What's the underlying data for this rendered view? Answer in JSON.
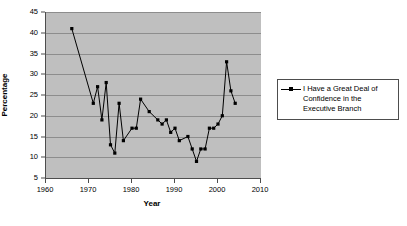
{
  "chart_data": {
    "type": "line",
    "title": "",
    "xlabel": "Year",
    "ylabel": "Percentage",
    "xlim": [
      1960,
      2010
    ],
    "ylim": [
      5,
      45
    ],
    "xticks": [
      1960,
      1970,
      1980,
      1990,
      2000,
      2010
    ],
    "yticks": [
      5,
      10,
      15,
      20,
      25,
      30,
      35,
      40,
      45
    ],
    "grid": "horizontal",
    "legend_position": "right",
    "plot_background": "#bfbfbf",
    "line_color": "#000000",
    "marker": "square",
    "series": [
      {
        "name": "I Have a Great Deal of Confidence in the Executive Branch",
        "x": [
          1966,
          1971,
          1972,
          1973,
          1974,
          1975,
          1976,
          1977,
          1978,
          1980,
          1981,
          1982,
          1984,
          1986,
          1987,
          1988,
          1989,
          1990,
          1991,
          1993,
          1994,
          1995,
          1996,
          1997,
          1998,
          1999,
          2000,
          2001,
          2002,
          2003,
          2004
        ],
        "values": [
          41,
          23,
          27,
          19,
          28,
          13,
          11,
          23,
          14,
          17,
          17,
          24,
          21,
          19,
          18,
          19,
          16,
          17,
          14,
          15,
          12,
          9,
          12,
          12,
          17,
          17,
          18,
          20,
          33,
          26,
          23
        ]
      }
    ]
  },
  "legend": {
    "entries": [
      {
        "label": "I Have a Great Deal of Confidence in the Executive Branch"
      }
    ]
  }
}
